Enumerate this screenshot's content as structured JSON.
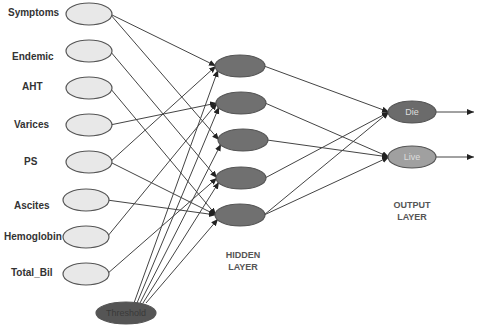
{
  "diagram": {
    "type": "neural-network",
    "input_layer": {
      "nodes": [
        {
          "label": "Symptoms",
          "cx": 89,
          "cy": 14
        },
        {
          "label": "Endemic",
          "cx": 89,
          "cy": 51
        },
        {
          "label": "AHT",
          "cx": 89,
          "cy": 88
        },
        {
          "label": "Varices",
          "cx": 89,
          "cy": 125
        },
        {
          "label": "PS",
          "cx": 89,
          "cy": 162
        },
        {
          "label": "Ascites",
          "cx": 86,
          "cy": 200
        },
        {
          "label": "Hemoglobin",
          "cx": 86,
          "cy": 237
        },
        {
          "label": "Total_Bil",
          "cx": 86,
          "cy": 274
        }
      ],
      "fill": "#e8e8e8",
      "stroke": "#555555"
    },
    "threshold": {
      "label": "Threshold",
      "cx": 126,
      "cy": 313,
      "fill": "#555555",
      "text_color": "#3a3a3a"
    },
    "hidden_layer": {
      "title_line1": "HIDDEN",
      "title_line2": "LAYER",
      "nodes": [
        {
          "cx": 240,
          "cy": 66
        },
        {
          "cx": 241,
          "cy": 103
        },
        {
          "cx": 243,
          "cy": 140
        },
        {
          "cx": 241,
          "cy": 178
        },
        {
          "cx": 240,
          "cy": 215
        }
      ],
      "fill": "#707070"
    },
    "output_layer": {
      "title_line1": "OUTPUT",
      "title_line2": "LAYER",
      "nodes": [
        {
          "label": "Die",
          "cx": 412,
          "cy": 112,
          "fill": "#6b6b6b"
        },
        {
          "label": "Live",
          "cx": 412,
          "cy": 157,
          "fill": "#a0a0a0"
        }
      ]
    },
    "edges_input_to_hidden": [
      [
        0,
        0
      ],
      [
        0,
        2
      ],
      [
        1,
        3
      ],
      [
        2,
        4
      ],
      [
        3,
        1
      ],
      [
        4,
        0
      ],
      [
        4,
        4
      ],
      [
        5,
        4
      ],
      [
        6,
        1
      ],
      [
        7,
        3
      ]
    ],
    "edges_threshold_to_hidden": [
      0,
      1,
      2,
      3,
      4
    ],
    "edges_hidden_to_output": [
      [
        0,
        0
      ],
      [
        1,
        1
      ],
      [
        2,
        1
      ],
      [
        3,
        0
      ],
      [
        4,
        0
      ],
      [
        4,
        1
      ]
    ],
    "output_arrows": true
  }
}
